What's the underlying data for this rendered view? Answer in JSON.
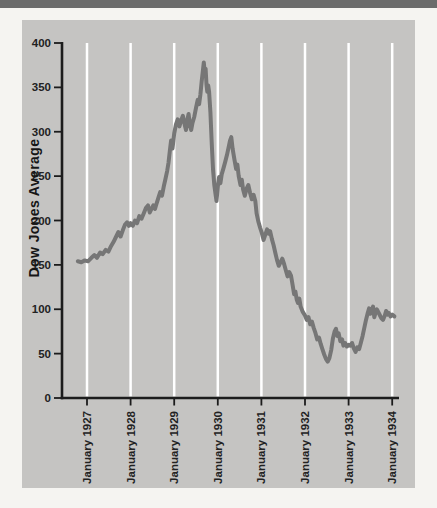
{
  "colors": {
    "page_bg": "#f5f4f1",
    "top_bar": "#6b6b6b",
    "panel_bg": "#c5c4c2",
    "gridline": "#ffffff",
    "axis": "#1c1c1c",
    "tick_label": "#222222",
    "line": "#767676"
  },
  "chart_data": {
    "type": "line",
    "title": "",
    "xlabel": "",
    "ylabel": "Dow Jones Average",
    "ylim": [
      0,
      400
    ],
    "y_ticks": [
      0,
      50,
      100,
      150,
      200,
      250,
      300,
      350,
      400
    ],
    "x_tick_years": [
      1927,
      1928,
      1929,
      1930,
      1931,
      1932,
      1933,
      1934
    ],
    "x_tick_labels": [
      "January 1927",
      "January 1928",
      "January 1929",
      "January 1930",
      "January 1931",
      "January 1932",
      "January 1933",
      "January 1934"
    ],
    "grid": "vertical white gridline at each January, behind data line",
    "legend": "none",
    "series": [
      {
        "name": "Dow Jones Average",
        "color": "#767676",
        "points": [
          [
            1926.79,
            154
          ],
          [
            1926.87,
            153
          ],
          [
            1926.95,
            155
          ],
          [
            1927.02,
            154
          ],
          [
            1927.1,
            158
          ],
          [
            1927.17,
            161
          ],
          [
            1927.23,
            158
          ],
          [
            1927.3,
            164
          ],
          [
            1927.36,
            162
          ],
          [
            1927.43,
            167
          ],
          [
            1927.49,
            165
          ],
          [
            1927.55,
            171
          ],
          [
            1927.61,
            176
          ],
          [
            1927.67,
            182
          ],
          [
            1927.72,
            187
          ],
          [
            1927.77,
            182
          ],
          [
            1927.82,
            189
          ],
          [
            1927.87,
            195
          ],
          [
            1927.92,
            198
          ],
          [
            1927.96,
            194
          ],
          [
            1928.0,
            197
          ],
          [
            1928.05,
            194
          ],
          [
            1928.1,
            200
          ],
          [
            1928.15,
            197
          ],
          [
            1928.2,
            205
          ],
          [
            1928.25,
            202
          ],
          [
            1928.3,
            208
          ],
          [
            1928.35,
            214
          ],
          [
            1928.4,
            217
          ],
          [
            1928.44,
            209
          ],
          [
            1928.48,
            213
          ],
          [
            1928.52,
            217
          ],
          [
            1928.56,
            213
          ],
          [
            1928.6,
            220
          ],
          [
            1928.64,
            226
          ],
          [
            1928.68,
            232
          ],
          [
            1928.72,
            228
          ],
          [
            1928.76,
            238
          ],
          [
            1928.8,
            247
          ],
          [
            1928.84,
            256
          ],
          [
            1928.87,
            265
          ],
          [
            1928.9,
            278
          ],
          [
            1928.93,
            290
          ],
          [
            1928.96,
            281
          ],
          [
            1929.0,
            298
          ],
          [
            1929.04,
            308
          ],
          [
            1929.08,
            314
          ],
          [
            1929.12,
            306
          ],
          [
            1929.16,
            313
          ],
          [
            1929.2,
            318
          ],
          [
            1929.24,
            308
          ],
          [
            1929.27,
            302
          ],
          [
            1929.3,
            313
          ],
          [
            1929.33,
            320
          ],
          [
            1929.36,
            308
          ],
          [
            1929.39,
            302
          ],
          [
            1929.42,
            310
          ],
          [
            1929.46,
            317
          ],
          [
            1929.5,
            327
          ],
          [
            1929.54,
            336
          ],
          [
            1929.57,
            331
          ],
          [
            1929.6,
            342
          ],
          [
            1929.63,
            357
          ],
          [
            1929.66,
            370
          ],
          [
            1929.68,
            378
          ],
          [
            1929.7,
            367
          ],
          [
            1929.72,
            371
          ],
          [
            1929.74,
            353
          ],
          [
            1929.76,
            345
          ],
          [
            1929.78,
            352
          ],
          [
            1929.8,
            345
          ],
          [
            1929.83,
            322
          ],
          [
            1929.86,
            288
          ],
          [
            1929.89,
            258
          ],
          [
            1929.92,
            240
          ],
          [
            1929.95,
            229
          ],
          [
            1929.97,
            222
          ],
          [
            1930.0,
            238
          ],
          [
            1930.03,
            249
          ],
          [
            1930.06,
            242
          ],
          [
            1930.09,
            252
          ],
          [
            1930.13,
            259
          ],
          [
            1930.17,
            266
          ],
          [
            1930.21,
            274
          ],
          [
            1930.25,
            283
          ],
          [
            1930.28,
            290
          ],
          [
            1930.31,
            294
          ],
          [
            1930.34,
            281
          ],
          [
            1930.38,
            269
          ],
          [
            1930.42,
            258
          ],
          [
            1930.45,
            263
          ],
          [
            1930.48,
            250
          ],
          [
            1930.52,
            240
          ],
          [
            1930.55,
            246
          ],
          [
            1930.58,
            235
          ],
          [
            1930.62,
            228
          ],
          [
            1930.66,
            236
          ],
          [
            1930.7,
            240
          ],
          [
            1930.74,
            231
          ],
          [
            1930.78,
            224
          ],
          [
            1930.82,
            229
          ],
          [
            1930.86,
            222
          ],
          [
            1930.89,
            208
          ],
          [
            1930.93,
            199
          ],
          [
            1930.97,
            192
          ],
          [
            1931.01,
            186
          ],
          [
            1931.05,
            178
          ],
          [
            1931.09,
            184
          ],
          [
            1931.13,
            190
          ],
          [
            1931.17,
            185
          ],
          [
            1931.2,
            188
          ],
          [
            1931.24,
            179
          ],
          [
            1931.28,
            172
          ],
          [
            1931.32,
            163
          ],
          [
            1931.36,
            155
          ],
          [
            1931.4,
            149
          ],
          [
            1931.44,
            153
          ],
          [
            1931.48,
            157
          ],
          [
            1931.52,
            151
          ],
          [
            1931.56,
            144
          ],
          [
            1931.6,
            137
          ],
          [
            1931.64,
            142
          ],
          [
            1931.68,
            138
          ],
          [
            1931.72,
            126
          ],
          [
            1931.75,
            117
          ],
          [
            1931.78,
            120
          ],
          [
            1931.81,
            111
          ],
          [
            1931.84,
            107
          ],
          [
            1931.87,
            112
          ],
          [
            1931.9,
            103
          ],
          [
            1931.95,
            97
          ],
          [
            1932.0,
            93
          ],
          [
            1932.04,
            88
          ],
          [
            1932.08,
            91
          ],
          [
            1932.12,
            83
          ],
          [
            1932.16,
            86
          ],
          [
            1932.2,
            79
          ],
          [
            1932.24,
            73
          ],
          [
            1932.28,
            66
          ],
          [
            1932.32,
            68
          ],
          [
            1932.36,
            61
          ],
          [
            1932.4,
            55
          ],
          [
            1932.44,
            49
          ],
          [
            1932.48,
            44
          ],
          [
            1932.52,
            41
          ],
          [
            1932.56,
            45
          ],
          [
            1932.6,
            54
          ],
          [
            1932.64,
            67
          ],
          [
            1932.68,
            75
          ],
          [
            1932.71,
            78
          ],
          [
            1932.74,
            70
          ],
          [
            1932.77,
            73
          ],
          [
            1932.81,
            64
          ],
          [
            1932.85,
            66
          ],
          [
            1932.88,
            59
          ],
          [
            1932.92,
            62
          ],
          [
            1932.96,
            58
          ],
          [
            1933.0,
            60
          ],
          [
            1933.04,
            59
          ],
          [
            1933.08,
            62
          ],
          [
            1933.12,
            56
          ],
          [
            1933.16,
            52
          ],
          [
            1933.2,
            57
          ],
          [
            1933.24,
            55
          ],
          [
            1933.28,
            62
          ],
          [
            1933.32,
            70
          ],
          [
            1933.36,
            79
          ],
          [
            1933.4,
            88
          ],
          [
            1933.44,
            96
          ],
          [
            1933.47,
            101
          ],
          [
            1933.5,
            95
          ],
          [
            1933.53,
            99
          ],
          [
            1933.56,
            103
          ],
          [
            1933.59,
            91
          ],
          [
            1933.62,
            96
          ],
          [
            1933.65,
            100
          ],
          [
            1933.68,
            97
          ],
          [
            1933.72,
            93
          ],
          [
            1933.75,
            90
          ],
          [
            1933.79,
            88
          ],
          [
            1933.83,
            93
          ],
          [
            1933.86,
            98
          ],
          [
            1933.89,
            94
          ],
          [
            1933.92,
            96
          ],
          [
            1933.96,
            92
          ],
          [
            1934.0,
            94
          ],
          [
            1934.05,
            92
          ]
        ]
      }
    ]
  }
}
